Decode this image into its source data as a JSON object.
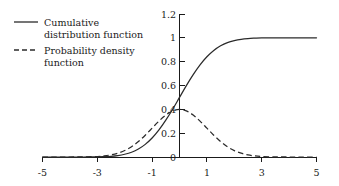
{
  "chart_data": {
    "type": "line",
    "title": "",
    "subtitle": "",
    "xlabel": "",
    "ylabel": "",
    "xlim": [
      -5,
      5
    ],
    "ylim": [
      0,
      1.2
    ],
    "grid": false,
    "legend_position": "top-left",
    "x_ticks": [
      "-5",
      "-3",
      "-1",
      "1",
      "3",
      "5"
    ],
    "x_tick_values": [
      -5,
      -3,
      -1,
      1,
      3,
      5
    ],
    "y_ticks": [
      "0",
      "0.2",
      "0.4",
      "0.6",
      "0.8",
      "1",
      "1.2"
    ],
    "y_tick_values": [
      0,
      0.2,
      0.4,
      0.6,
      0.8,
      1,
      1.2
    ],
    "series": [
      {
        "name": "Cumulative distribution function",
        "style": "solid",
        "color": "#2b2b2b",
        "x": [
          -5,
          -4.5,
          -4,
          -3.5,
          -3,
          -2.75,
          -2.5,
          -2.25,
          -2,
          -1.75,
          -1.5,
          -1.25,
          -1,
          -0.75,
          -0.5,
          -0.25,
          0,
          0.25,
          0.5,
          0.75,
          1,
          1.25,
          1.5,
          1.75,
          2,
          2.25,
          2.5,
          2.75,
          3,
          3.5,
          4,
          4.5,
          5
        ],
        "values": [
          0.0,
          0.0,
          0.0,
          0.0,
          0.001,
          0.003,
          0.006,
          0.012,
          0.023,
          0.04,
          0.067,
          0.106,
          0.159,
          0.227,
          0.309,
          0.401,
          0.5,
          0.599,
          0.691,
          0.773,
          0.841,
          0.894,
          0.933,
          0.96,
          0.977,
          0.988,
          0.994,
          0.997,
          0.999,
          1.0,
          1.0,
          1.0,
          1.0
        ]
      },
      {
        "name": "Probability density function",
        "style": "dashed",
        "color": "#2b2b2b",
        "x": [
          -5,
          -4.5,
          -4,
          -3.5,
          -3,
          -2.75,
          -2.5,
          -2.25,
          -2,
          -1.75,
          -1.5,
          -1.25,
          -1,
          -0.75,
          -0.5,
          -0.25,
          0,
          0.25,
          0.5,
          0.75,
          1,
          1.25,
          1.5,
          1.75,
          2,
          2.25,
          2.5,
          2.75,
          3,
          3.5,
          4,
          4.5,
          5
        ],
        "values": [
          0.0,
          0.0,
          0.0,
          0.001,
          0.004,
          0.009,
          0.018,
          0.032,
          0.054,
          0.086,
          0.13,
          0.183,
          0.242,
          0.301,
          0.352,
          0.387,
          0.399,
          0.387,
          0.352,
          0.301,
          0.242,
          0.183,
          0.13,
          0.086,
          0.054,
          0.032,
          0.018,
          0.009,
          0.004,
          0.001,
          0.0,
          0.0,
          0.0
        ]
      }
    ],
    "annotations": []
  },
  "legend": {
    "items": [
      {
        "line1": "Cumulative",
        "line2": "distribution function",
        "style": "solid"
      },
      {
        "line1": "Probability density",
        "line2": "function",
        "style": "dashed"
      }
    ]
  },
  "colors": {
    "curve": "#2b2b2b",
    "axis": "#1a1a1a",
    "background": "#ffffff"
  }
}
